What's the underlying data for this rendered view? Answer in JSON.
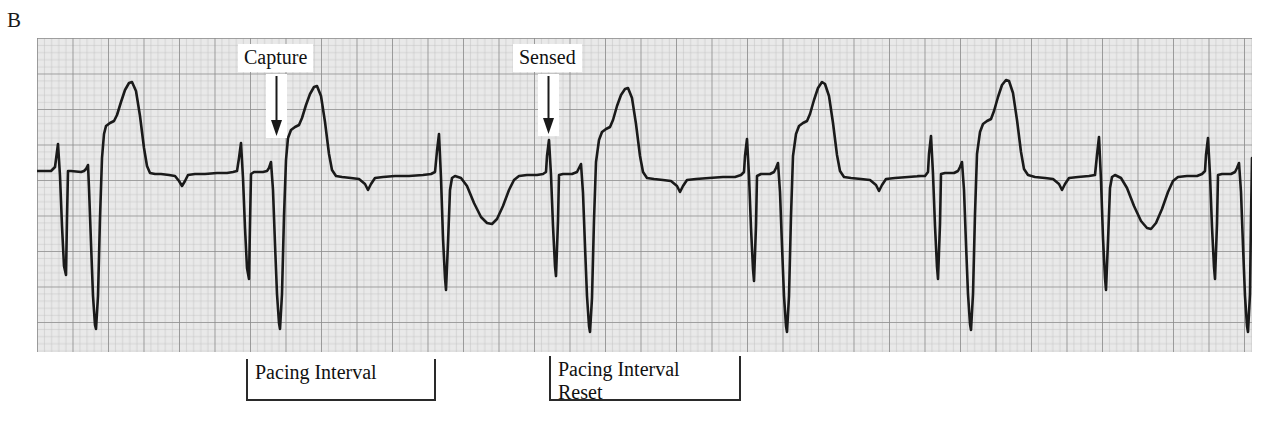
{
  "figure": {
    "panel_label": "B",
    "caption_type": "ecg-rhythm-strip"
  },
  "colors": {
    "grid_background": "#e9e9e9",
    "grid_fine_line": "#b4b4b4",
    "grid_bold_line": "#8a8a8a",
    "trace": "#1a1a1a",
    "annotation_text": "#111111",
    "page_background": "#ffffff"
  },
  "annotations": [
    {
      "id": "capture",
      "label": "Capture",
      "arrow": "down-arrow-icon",
      "x": 238,
      "text_y": 44,
      "arrow_x": 276,
      "arrow_top": 78,
      "arrow_bottom": 136
    },
    {
      "id": "sensed",
      "label": "Sensed",
      "arrow": "down-arrow-icon",
      "x": 513,
      "text_y": 44,
      "arrow_x": 548,
      "arrow_top": 78,
      "arrow_bottom": 134
    }
  ],
  "brackets": [
    {
      "id": "pacing-interval",
      "label": "Pacing Interval",
      "x": 246,
      "y": 359,
      "width": 190,
      "height": 42
    },
    {
      "id": "pacing-interval-reset",
      "label": "Pacing Interval\nReset",
      "x": 549,
      "y": 356,
      "width": 192,
      "height": 45
    }
  ],
  "strip": {
    "x": 37,
    "y": 38,
    "width": 1215,
    "height": 314,
    "grid_fine_px": 7.1,
    "grid_bold_every": 5,
    "baseline_y": 133
  },
  "chart_data": {
    "type": "line",
    "xlabel": "Time",
    "ylabel": "Amplitude",
    "grid": true,
    "legend": "none",
    "xlim": [
      0,
      1215
    ],
    "ylim": [
      0,
      314
    ],
    "baseline": 133,
    "series": [
      {
        "name": "ecg-trace",
        "beats": [
          {
            "type": "paced",
            "spike_x": 22,
            "qrs_x": 52,
            "t_peak_x": 95,
            "t_peak_y": 44
          },
          {
            "type": "paced",
            "spike_x": 203,
            "qrs_x": 236,
            "t_peak_x": 279,
            "t_peak_y": 48
          },
          {
            "type": "sensed",
            "spike_x": 400,
            "qrs_x": 404,
            "t_trough_x": 455,
            "t_trough_y": 185
          },
          {
            "type": "paced",
            "spike_x": 510,
            "qrs_x": 545,
            "t_peak_x": 585,
            "t_peak_y": 50
          },
          {
            "type": "paced",
            "spike_x": 707,
            "qrs_x": 740,
            "t_peak_x": 782,
            "t_peak_y": 46
          },
          {
            "type": "paced",
            "spike_x": 890,
            "qrs_x": 925,
            "t_peak_x": 968,
            "t_peak_y": 42
          },
          {
            "type": "sensed",
            "spike_x": 1060,
            "qrs_x": 1064,
            "t_trough_x": 1112,
            "t_trough_y": 190
          },
          {
            "type": "paced",
            "spike_x": 1168,
            "qrs_x": 1200,
            "t_peak_x": 1238,
            "t_peak_y": 46
          }
        ],
        "path": "M 0 133 L 14 133 L 18 129 L 21 106 L 23 138 L 25 188 L 27 228 L 29 237 L 30 180 L 31 133 L 34 133 L 44 134 L 47 133 L 49 131 L 51 127 L 52 150 L 54 205 L 56 258 L 58 287 L 59 291 L 61 258 L 63 180 L 65 120 L 67 96 L 69 88 L 73 85 L 77 83 L 80 77 L 84 64 L 88 52 L 92 45 L 95 44 L 99 53 L 103 78 L 107 110 L 110 128 L 113 135 L 118 136 L 124 136 L 132 137 L 138 138 L 142 143 L 145 148 L 148 143 L 151 137 L 158 136 L 168 136 L 180 135 L 190 135 L 196 134 L 200 133 L 202 120 L 204 105 L 206 140 L 208 190 L 210 230 L 212 241 L 213 186 L 214 136 L 217 134 L 226 134 L 230 133 L 232 130 L 234 124 L 236 152 L 238 206 L 240 256 L 242 285 L 243 291 L 245 256 L 247 178 L 249 122 L 251 100 L 254 92 L 258 89 L 262 87 L 265 80 L 269 67 L 273 56 L 277 49 L 280 48 L 284 58 L 288 84 L 292 116 L 295 132 L 299 138 L 305 139 L 314 140 L 322 141 L 328 146 L 331 152 L 334 146 L 338 140 L 346 139 L 358 138 L 372 138 L 386 137 L 394 136 L 398 134 L 400 113 L 402 96 L 404 140 L 406 200 L 408 240 L 409 252 L 411 205 L 413 152 L 415 140 L 418 138 L 424 140 L 430 148 L 437 165 L 444 179 L 450 185 L 455 186 L 460 181 L 466 168 L 472 152 L 477 142 L 482 138 L 490 137 L 500 137 L 506 136 L 509 134 L 510 118 L 512 102 L 514 137 L 516 188 L 518 228 L 519 238 L 521 183 L 522 137 L 526 136 L 535 136 L 540 134 L 542 130 L 544 126 L 546 155 L 548 208 L 550 258 L 552 288 L 553 294 L 555 260 L 557 182 L 559 124 L 562 102 L 565 94 L 569 91 L 573 89 L 576 82 L 580 68 L 584 57 L 588 51 L 591 50 L 595 60 L 599 86 L 603 118 L 606 134 L 610 140 L 617 141 L 626 142 L 634 143 L 640 148 L 643 154 L 646 148 L 650 142 L 659 141 L 672 140 L 686 139 L 698 139 L 704 137 L 707 134 L 708 118 L 710 101 L 712 138 L 714 190 L 716 231 L 717 243 L 719 188 L 720 138 L 724 136 L 733 136 L 737 134 L 739 130 L 741 125 L 743 154 L 745 208 L 747 258 L 749 288 L 750 294 L 752 258 L 754 178 L 756 118 L 759 96 L 762 88 L 766 85 L 770 83 L 773 76 L 777 62 L 781 50 L 785 44 L 788 46 L 792 58 L 796 85 L 800 117 L 803 133 L 807 139 L 814 140 L 824 141 L 833 142 L 839 147 L 842 153 L 845 147 L 849 141 L 858 140 L 871 139 L 884 138 L 881 138 L 888 138 L 891 134 L 892 116 L 894 98 L 896 136 L 898 188 L 900 229 L 901 241 L 903 186 L 904 136 L 908 135 L 917 135 L 921 133 L 923 129 L 925 124 L 927 152 L 929 206 L 931 256 L 933 286 L 934 292 L 936 256 L 938 176 L 940 116 L 943 94 L 946 86 L 950 83 L 954 81 L 957 73 L 961 59 L 965 47 L 969 42 L 972 43 L 976 55 L 980 82 L 984 114 L 987 131 L 991 137 L 998 139 L 1008 140 L 1016 141 L 1022 146 L 1025 152 L 1028 146 L 1032 140 L 1041 139 L 1052 138 L 1058 137 L 1060 117 L 1062 99 L 1064 142 L 1066 200 L 1068 240 L 1069 252 L 1071 203 L 1073 150 L 1075 139 L 1078 137 L 1084 140 L 1090 150 L 1097 168 L 1104 183 L 1110 190 L 1114 191 L 1119 185 L 1125 171 L 1131 154 L 1136 143 L 1141 139 L 1150 138 L 1160 138 L 1165 136 L 1168 133 L 1169 117 L 1171 100 L 1173 137 L 1175 189 L 1177 229 L 1178 241 L 1180 186 L 1181 137 L 1185 136 L 1194 136 L 1198 134 L 1200 130 L 1202 125 L 1204 154 L 1206 208 L 1208 258 L 1210 288 L 1211 294 L 1213 256 L 1214 180 L 1215 120"
      }
    ]
  }
}
